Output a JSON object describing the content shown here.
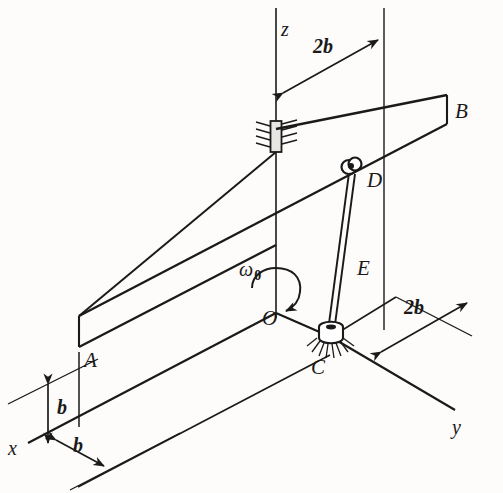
{
  "figure": {
    "background_color": "#fdfcfa",
    "line_color": "#1a1a1a",
    "type": "engineering-mechanics-isometric-diagram"
  },
  "axes": {
    "z": "z",
    "x": "x",
    "y": "y"
  },
  "points": {
    "origin": "O",
    "a": "A",
    "b": "B",
    "c": "C",
    "d": "D",
    "e": "E"
  },
  "dimensions": {
    "top_2b": "2b",
    "right_2b": "2b",
    "vertical_b": "b",
    "horizontal_b": "b"
  },
  "rotation": {
    "symbol": "ω",
    "subscript": "0"
  },
  "components": {
    "bearing_label": "bearing-support",
    "pin_label": "pin-joint-D",
    "collar_label": "collar-C",
    "rod_label": "link-rod-DC",
    "plate_label": "inclined-plate"
  }
}
